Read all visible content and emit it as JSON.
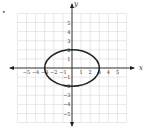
{
  "problem_marker": "•",
  "chart_data": {
    "type": "line",
    "title": "",
    "xlabel": "x",
    "ylabel": "y",
    "xlim": [
      -6,
      6
    ],
    "ylim": [
      -6,
      6
    ],
    "grid": true,
    "x_ticks": [
      -5,
      -4,
      -3,
      -2,
      -1,
      1,
      2,
      3,
      4,
      5
    ],
    "y_ticks": [
      -5,
      -4,
      -3,
      -2,
      -1,
      1,
      2,
      3,
      4,
      5
    ],
    "series": [
      {
        "name": "ellipse",
        "equation": "x^2/9 + y^2/4 = 1",
        "center": [
          0,
          0
        ],
        "semi_axis_x": 3,
        "semi_axis_y": 2,
        "color": "#222222"
      }
    ]
  },
  "colors": {
    "grid": "#d8d8d8",
    "axis": "#222222",
    "curve": "#222222"
  }
}
